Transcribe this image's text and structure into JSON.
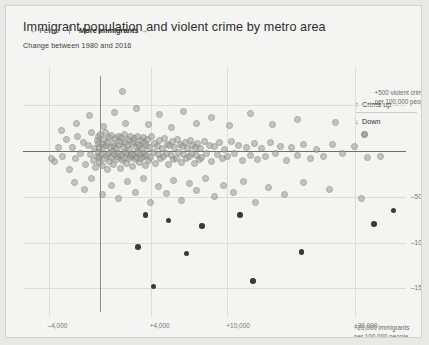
{
  "header": {
    "title": "Immigrant population and violent crime by metro area",
    "subtitle": "Change between 1980 and 2016"
  },
  "annotations": {
    "direction_left": "← Fewer",
    "direction_right": "More immigrants →",
    "y_note_line1": "+500 violent crimes",
    "y_note_line2": "per 100,000 people",
    "x_note_line1": "+20,000 immigrants",
    "x_note_line2": "per 100,000 people"
  },
  "legend": {
    "up_arrow": "↑",
    "up_label": "Crime up",
    "down_arrow": "↓",
    "down_label": "Down"
  },
  "chart_data": {
    "type": "scatter",
    "title": "Immigrant population and violent crime by metro area",
    "subtitle": "Change between 1980 and 2016",
    "xlabel": "Change in immigrants per 100,000 people, 1980–2016",
    "ylabel": "Change in violent crimes per 100,000 people, 1980–2016",
    "xlim": [
      -6000,
      24000
    ],
    "ylim": [
      -1800,
      900
    ],
    "grid": true,
    "legend_position": "right",
    "xticks": [
      -4000,
      4000,
      10000,
      20000
    ],
    "xticklabels": [
      "–4,000",
      "+4,000",
      "+10,000",
      "+20,000"
    ],
    "yticks": [
      500,
      -500,
      -1000,
      -1500
    ],
    "yticklabels": [
      "+500",
      "–500",
      "–1000",
      "–1500"
    ],
    "marker": {
      "fill": "#a5a59f",
      "stroke": "#7d7d77",
      "opacity": 0.62,
      "size_px": 7
    },
    "zero_lines": {
      "x": 0,
      "y": 0
    },
    "points": [
      [
        -3500,
        -120
      ],
      [
        -3200,
        40
      ],
      [
        -2900,
        -60
      ],
      [
        -2600,
        120
      ],
      [
        -2400,
        -200
      ],
      [
        -2100,
        30
      ],
      [
        -1900,
        -90
      ],
      [
        -1700,
        160
      ],
      [
        -1500,
        -30
      ],
      [
        -1300,
        90
      ],
      [
        -1100,
        -150
      ],
      [
        -900,
        60
      ],
      [
        -700,
        -40
      ],
      [
        -600,
        200
      ],
      [
        -500,
        -110
      ],
      [
        -400,
        20
      ],
      [
        -300,
        -180
      ],
      [
        -200,
        110
      ],
      [
        -150,
        -60
      ],
      [
        -100,
        150
      ],
      [
        -80,
        -20
      ],
      [
        -60,
        80
      ],
      [
        -40,
        -130
      ],
      [
        -20,
        40
      ],
      [
        0,
        -70
      ],
      [
        100,
        180
      ],
      [
        150,
        -40
      ],
      [
        200,
        70
      ],
      [
        250,
        -160
      ],
      [
        300,
        30
      ],
      [
        350,
        120
      ],
      [
        400,
        -90
      ],
      [
        450,
        200
      ],
      [
        500,
        -50
      ],
      [
        550,
        60
      ],
      [
        600,
        -200
      ],
      [
        650,
        90
      ],
      [
        700,
        -30
      ],
      [
        750,
        140
      ],
      [
        800,
        -120
      ],
      [
        850,
        40
      ],
      [
        900,
        -70
      ],
      [
        950,
        170
      ],
      [
        1000,
        -10
      ],
      [
        1050,
        80
      ],
      [
        1100,
        -150
      ],
      [
        1150,
        50
      ],
      [
        1200,
        -40
      ],
      [
        1250,
        130
      ],
      [
        1300,
        -100
      ],
      [
        1350,
        20
      ],
      [
        1400,
        -60
      ],
      [
        1450,
        160
      ],
      [
        1500,
        -30
      ],
      [
        1550,
        70
      ],
      [
        1600,
        -190
      ],
      [
        1650,
        100
      ],
      [
        1700,
        -50
      ],
      [
        1750,
        140
      ],
      [
        1800,
        -110
      ],
      [
        1850,
        30
      ],
      [
        1900,
        -80
      ],
      [
        1950,
        180
      ],
      [
        2000,
        -20
      ],
      [
        2050,
        90
      ],
      [
        2100,
        -140
      ],
      [
        2150,
        60
      ],
      [
        2200,
        -30
      ],
      [
        2250,
        120
      ],
      [
        2300,
        -90
      ],
      [
        2350,
        10
      ],
      [
        2400,
        -60
      ],
      [
        2450,
        150
      ],
      [
        2500,
        -40
      ],
      [
        2550,
        80
      ],
      [
        2600,
        -170
      ],
      [
        2650,
        100
      ],
      [
        2700,
        -50
      ],
      [
        2750,
        130
      ],
      [
        2800,
        -100
      ],
      [
        2850,
        40
      ],
      [
        2900,
        -70
      ],
      [
        2950,
        160
      ],
      [
        3000,
        -20
      ],
      [
        3050,
        70
      ],
      [
        3100,
        -130
      ],
      [
        3150,
        50
      ],
      [
        3200,
        -40
      ],
      [
        3250,
        110
      ],
      [
        3300,
        -80
      ],
      [
        3350,
        20
      ],
      [
        3400,
        -60
      ],
      [
        3450,
        140
      ],
      [
        3500,
        -30
      ],
      [
        3550,
        90
      ],
      [
        3600,
        -160
      ],
      [
        3650,
        60
      ],
      [
        3700,
        -50
      ],
      [
        3750,
        120
      ],
      [
        3800,
        -110
      ],
      [
        3900,
        30
      ],
      [
        4000,
        -70
      ],
      [
        4100,
        150
      ],
      [
        4200,
        -20
      ],
      [
        4300,
        80
      ],
      [
        4400,
        -140
      ],
      [
        4500,
        50
      ],
      [
        4600,
        -40
      ],
      [
        4700,
        110
      ],
      [
        4800,
        -90
      ],
      [
        4900,
        20
      ],
      [
        5000,
        -60
      ],
      [
        5100,
        130
      ],
      [
        5200,
        -30
      ],
      [
        5300,
        70
      ],
      [
        5400,
        -150
      ],
      [
        5500,
        60
      ],
      [
        5600,
        -50
      ],
      [
        5700,
        100
      ],
      [
        5800,
        -100
      ],
      [
        5900,
        30
      ],
      [
        6000,
        -80
      ],
      [
        6100,
        120
      ],
      [
        6200,
        -20
      ],
      [
        6300,
        70
      ],
      [
        6400,
        -130
      ],
      [
        6500,
        50
      ],
      [
        6600,
        -40
      ],
      [
        6700,
        90
      ],
      [
        6800,
        -90
      ],
      [
        6900,
        20
      ],
      [
        7000,
        -60
      ],
      [
        7100,
        110
      ],
      [
        7200,
        -30
      ],
      [
        7300,
        60
      ],
      [
        7400,
        -140
      ],
      [
        7500,
        40
      ],
      [
        7600,
        -50
      ],
      [
        7700,
        80
      ],
      [
        7800,
        -100
      ],
      [
        7900,
        25
      ],
      [
        8000,
        -70
      ],
      [
        8200,
        100
      ],
      [
        8400,
        -25
      ],
      [
        8600,
        60
      ],
      [
        8800,
        -120
      ],
      [
        9000,
        45
      ],
      [
        9200,
        -45
      ],
      [
        9400,
        85
      ],
      [
        9600,
        -85
      ],
      [
        9800,
        15
      ],
      [
        10000,
        -65
      ],
      [
        10300,
        95
      ],
      [
        10600,
        -30
      ],
      [
        10900,
        55
      ],
      [
        11200,
        -110
      ],
      [
        11500,
        40
      ],
      [
        11800,
        -50
      ],
      [
        12100,
        75
      ],
      [
        12400,
        -95
      ],
      [
        12700,
        20
      ],
      [
        13000,
        -60
      ],
      [
        13400,
        85
      ],
      [
        13800,
        -25
      ],
      [
        14200,
        50
      ],
      [
        14600,
        -105
      ],
      [
        15000,
        35
      ],
      [
        15500,
        -55
      ],
      [
        16000,
        65
      ],
      [
        16500,
        -85
      ],
      [
        17000,
        15
      ],
      [
        17500,
        -60
      ],
      [
        18200,
        70
      ],
      [
        19000,
        -30
      ],
      [
        20000,
        45
      ],
      [
        21000,
        -70
      ],
      [
        -2000,
        -350
      ],
      [
        -1200,
        -420
      ],
      [
        -600,
        -300
      ],
      [
        200,
        -480
      ],
      [
        900,
        -380
      ],
      [
        1500,
        -520
      ],
      [
        2200,
        -340
      ],
      [
        2800,
        -450
      ],
      [
        3400,
        -300
      ],
      [
        4000,
        -560
      ],
      [
        4600,
        -390
      ],
      [
        5200,
        -470
      ],
      [
        5800,
        -320
      ],
      [
        6400,
        -540
      ],
      [
        7000,
        -360
      ],
      [
        7600,
        -430
      ],
      [
        8300,
        -300
      ],
      [
        9000,
        -500
      ],
      [
        9700,
        -380
      ],
      [
        10500,
        -450
      ],
      [
        11300,
        -330
      ],
      [
        12200,
        -560
      ],
      [
        13200,
        -400
      ],
      [
        14500,
        -480
      ],
      [
        16000,
        -350
      ],
      [
        18000,
        -420
      ],
      [
        20500,
        -520
      ],
      [
        -1800,
        300
      ],
      [
        -800,
        380
      ],
      [
        300,
        260
      ],
      [
        1200,
        420
      ],
      [
        2000,
        300
      ],
      [
        2900,
        460
      ],
      [
        3800,
        280
      ],
      [
        4700,
        390
      ],
      [
        5600,
        250
      ],
      [
        6600,
        430
      ],
      [
        7600,
        300
      ],
      [
        8800,
        360
      ],
      [
        10200,
        270
      ],
      [
        11800,
        400
      ],
      [
        13500,
        290
      ],
      [
        15500,
        340
      ],
      [
        18500,
        310
      ],
      [
        1800,
        640
      ],
      [
        3600,
        -700
      ],
      [
        5400,
        -760
      ],
      [
        8000,
        -820
      ],
      [
        11000,
        -700
      ],
      [
        3000,
        -1050
      ],
      [
        6800,
        -1120
      ],
      [
        4200,
        -1480
      ],
      [
        12000,
        -1420
      ],
      [
        15800,
        -1100
      ],
      [
        21500,
        -800
      ],
      [
        -3800,
        -80
      ],
      [
        -3000,
        220
      ],
      [
        22000,
        -60
      ],
      [
        23000,
        -650
      ]
    ]
  }
}
